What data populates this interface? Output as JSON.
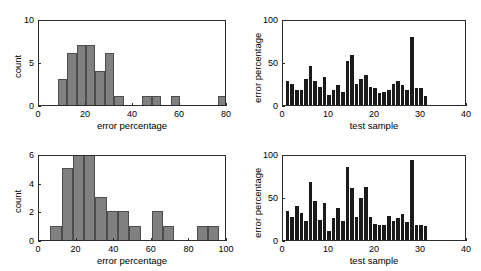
{
  "figure": {
    "title": "",
    "background": "#ffffff",
    "width": 481,
    "height": 271,
    "hist_bar_color": "#808080",
    "hist_bar_edge": "#4d4d4d",
    "bar_color": "#1a1a1a",
    "axis_color": "#2b2b2b"
  },
  "chart_data": [
    {
      "id": "top-left",
      "type": "bar",
      "subtype": "histogram",
      "title": "",
      "xlabel": "error percentage",
      "ylabel": "count",
      "xlim": [
        0,
        80
      ],
      "ylim": [
        0,
        10
      ],
      "xticks": [
        0,
        20,
        40,
        60,
        80
      ],
      "xticklabels": [
        "0",
        "20",
        "40",
        "60",
        "80"
      ],
      "yticks": [
        0,
        5,
        10
      ],
      "yticklabels": [
        "0",
        "5",
        "10"
      ],
      "grid": false,
      "legend": null,
      "bin_width": 4,
      "bin_left_edges": [
        8,
        12,
        16,
        20,
        24,
        28,
        32,
        44,
        48,
        56,
        76
      ],
      "bin_centers": [
        10,
        14,
        18,
        22,
        26,
        30,
        34,
        46,
        50,
        58,
        78
      ],
      "values": [
        3,
        6,
        7,
        7,
        4,
        6,
        1,
        1,
        1,
        1,
        1
      ],
      "color": "#808080"
    },
    {
      "id": "top-right",
      "type": "bar",
      "subtype": "bar",
      "title": "",
      "xlabel": "test sample",
      "ylabel": "error percentage",
      "xlim": [
        0,
        40
      ],
      "ylim": [
        0,
        100
      ],
      "xticks": [
        0,
        10,
        20,
        30,
        40
      ],
      "xticklabels": [
        "0",
        "10",
        "20",
        "30",
        "40"
      ],
      "yticks": [
        0,
        50,
        100
      ],
      "yticklabels": [
        "0",
        "50",
        "100"
      ],
      "grid": false,
      "legend": null,
      "x": [
        1,
        2,
        3,
        4,
        5,
        6,
        7,
        8,
        9,
        10,
        11,
        12,
        13,
        14,
        15,
        16,
        17,
        18,
        19,
        20,
        21,
        22,
        23,
        24,
        25,
        26,
        27,
        28,
        29,
        30,
        31
      ],
      "values": [
        28,
        25,
        18,
        17,
        30,
        45,
        28,
        21,
        32,
        12,
        17,
        23,
        15,
        51,
        58,
        25,
        30,
        35,
        21,
        20,
        14,
        15,
        17,
        25,
        28,
        23,
        17,
        79,
        20,
        20,
        10
      ],
      "color": "#1a1a1a"
    },
    {
      "id": "bottom-left",
      "type": "bar",
      "subtype": "histogram",
      "title": "",
      "xlabel": "error percentage",
      "ylabel": "count",
      "xlim": [
        0,
        100
      ],
      "ylim": [
        0,
        6
      ],
      "xticks": [
        0,
        20,
        40,
        60,
        80,
        100
      ],
      "xticklabels": [
        "0",
        "20",
        "40",
        "60",
        "80",
        "100"
      ],
      "yticks": [
        0,
        2,
        4,
        6
      ],
      "yticklabels": [
        "0",
        "2",
        "4",
        "6"
      ],
      "grid": false,
      "legend": null,
      "bin_width": 6,
      "bin_left_edges": [
        6,
        12,
        18,
        24,
        30,
        36,
        42,
        48,
        60,
        66,
        84,
        90
      ],
      "bin_centers": [
        9,
        15,
        21,
        27,
        33,
        39,
        45,
        51,
        63,
        69,
        87,
        93
      ],
      "values": [
        1,
        5,
        6,
        6,
        3,
        2,
        2,
        1,
        2,
        1,
        1,
        1
      ],
      "color": "#808080"
    },
    {
      "id": "bottom-right",
      "type": "bar",
      "subtype": "bar",
      "title": "",
      "xlabel": "test sample",
      "ylabel": "error percentage",
      "xlim": [
        0,
        40
      ],
      "ylim": [
        0,
        100
      ],
      "xticks": [
        0,
        10,
        20,
        30,
        40
      ],
      "xticklabels": [
        "0",
        "10",
        "20",
        "30",
        "40"
      ],
      "yticks": [
        0,
        50,
        100
      ],
      "yticklabels": [
        "0",
        "50",
        "100"
      ],
      "grid": false,
      "legend": null,
      "x": [
        1,
        2,
        3,
        4,
        5,
        6,
        7,
        8,
        9,
        10,
        11,
        12,
        13,
        14,
        15,
        16,
        17,
        18,
        19,
        20,
        21,
        22,
        23,
        24,
        25,
        26,
        27,
        28,
        29,
        30,
        31
      ],
      "values": [
        34,
        27,
        40,
        31,
        22,
        68,
        45,
        23,
        43,
        11,
        26,
        37,
        22,
        85,
        60,
        27,
        49,
        62,
        27,
        19,
        18,
        18,
        28,
        22,
        26,
        30,
        21,
        93,
        17,
        17,
        16
      ],
      "color": "#1a1a1a"
    }
  ]
}
